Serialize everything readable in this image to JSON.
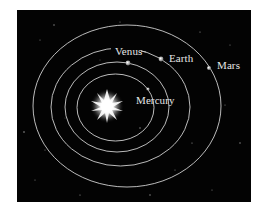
{
  "diagram": {
    "background_color": "#030303",
    "orbit_color": "#cfcfcf",
    "label_color": "#e6e6e6",
    "sun": {
      "icon": "star-burst-icon",
      "cx": 107,
      "cy": 106
    },
    "orbits": [
      {
        "name": "Mercury",
        "cx": 115.5,
        "cy": 107.5,
        "rx": 38.5,
        "ry": 33.5
      },
      {
        "name": "Venus",
        "cx": 117,
        "cy": 107,
        "rx": 52,
        "ry": 45
      },
      {
        "name": "Earth",
        "cx": 120.5,
        "cy": 107,
        "rx": 69.5,
        "ry": 59
      },
      {
        "name": "Mars",
        "cx": 127,
        "cy": 106,
        "rx": 94,
        "ry": 81
      }
    ],
    "planets": [
      {
        "name": "Mercury",
        "x": 148,
        "y": 89
      },
      {
        "name": "Venus",
        "x": 128,
        "y": 63
      },
      {
        "name": "Earth",
        "x": 161,
        "y": 59
      },
      {
        "name": "Mars",
        "x": 209,
        "y": 68
      }
    ],
    "labels": {
      "mercury": "Mercury",
      "venus": "Venus",
      "earth": "Earth",
      "mars": "Mars"
    }
  }
}
